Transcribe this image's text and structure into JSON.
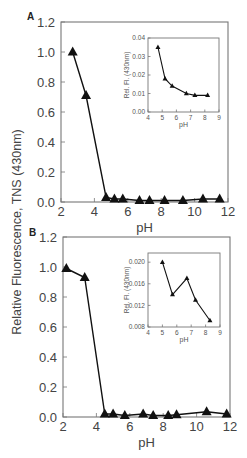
{
  "figure": {
    "shared_ylabel": "Relative Fluorescence, TNS (430nm)"
  },
  "chart_data": [
    {
      "panel": "A",
      "type": "line",
      "marker": "triangle",
      "xlabel": "pH",
      "ylabel": "Relative Fluorescence, TNS (430nm)",
      "xlim": [
        2,
        12
      ],
      "ylim": [
        0,
        1.2
      ],
      "xticks": [
        "2",
        "4",
        "6",
        "8",
        "10",
        "12"
      ],
      "yticks": [
        "0.0",
        "0.2",
        "0.4",
        "0.6",
        "0.8",
        "1.0",
        "1.2"
      ],
      "x": [
        2.7,
        3.5,
        4.7,
        5.2,
        5.7,
        6.7,
        7.3,
        8.2,
        9.3,
        10.5,
        11.5
      ],
      "y": [
        1.0,
        0.71,
        0.03,
        0.02,
        0.02,
        0.01,
        0.01,
        0.01,
        0.01,
        0.02,
        0.02
      ],
      "grid": false,
      "inset": {
        "type": "line",
        "marker": "triangle",
        "xlabel": "pH",
        "ylabel": "Rel. Fl. (430nm)",
        "xlim": [
          4,
          9
        ],
        "ylim": [
          0.0,
          0.04
        ],
        "xticks": [
          "4",
          "5",
          "6",
          "7",
          "8",
          "9"
        ],
        "yticks": [
          "0.00",
          "0.01",
          "0.02",
          "0.03",
          "0.04"
        ],
        "x": [
          4.7,
          5.2,
          5.7,
          6.7,
          7.3,
          8.2
        ],
        "y": [
          0.035,
          0.018,
          0.014,
          0.01,
          0.009,
          0.009
        ]
      }
    },
    {
      "panel": "B",
      "type": "line",
      "marker": "triangle",
      "xlabel": "pH",
      "ylabel": "Relative Fluorescence, TNS (430nm)",
      "xlim": [
        2,
        12
      ],
      "ylim": [
        0,
        1.2
      ],
      "xticks": [
        "2",
        "4",
        "6",
        "8",
        "10",
        "12"
      ],
      "yticks": [
        "0.0",
        "0.2",
        "0.4",
        "0.6",
        "0.8",
        "1.0",
        "1.2"
      ],
      "x": [
        2.2,
        3.3,
        4.5,
        5.0,
        5.7,
        6.8,
        7.4,
        8.3,
        8.8,
        10.6,
        11.8
      ],
      "y": [
        0.99,
        0.93,
        0.02,
        0.02,
        0.01,
        0.02,
        0.01,
        0.01,
        0.015,
        0.035,
        0.02
      ],
      "grid": false,
      "inset": {
        "type": "line",
        "marker": "triangle",
        "xlabel": "pH",
        "ylabel": "Rel. Fl. (430nm)",
        "xlim": [
          4,
          9
        ],
        "ylim": [
          0.008,
          0.0217
        ],
        "xticks": [
          "4",
          "5",
          "6",
          "7",
          "8",
          "9"
        ],
        "yticks": [
          "0.008",
          "0.012",
          "0.016",
          "0.020"
        ],
        "x": [
          5.0,
          5.7,
          6.7,
          7.3,
          8.3
        ],
        "y": [
          0.02,
          0.014,
          0.017,
          0.013,
          0.0092
        ]
      }
    }
  ]
}
